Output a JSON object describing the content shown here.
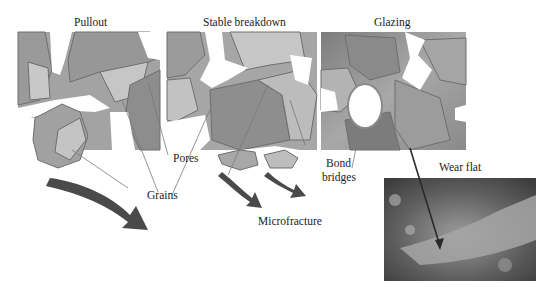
{
  "figure": {
    "panels": [
      {
        "id": "pullout",
        "title": "Pullout"
      },
      {
        "id": "stable-breakdown",
        "title": "Stable breakdown"
      },
      {
        "id": "glazing",
        "title": "Glazing"
      }
    ],
    "annotations": {
      "pores": "Pores",
      "grains": "Grains",
      "microfracture": "Microfracture",
      "bond_bridges_line1": "Bond",
      "bond_bridges_line2": "bridges",
      "wear_flat": "Wear flat"
    },
    "colors": {
      "grain_dark": "#8f8f8f",
      "grain_mid": "#a9a9a9",
      "grain_light": "#c9c9c9",
      "bond": "#9a9a9a",
      "outline": "#6e6e6e",
      "arrow": "#4a4a4a",
      "background": "#ffffff"
    }
  }
}
